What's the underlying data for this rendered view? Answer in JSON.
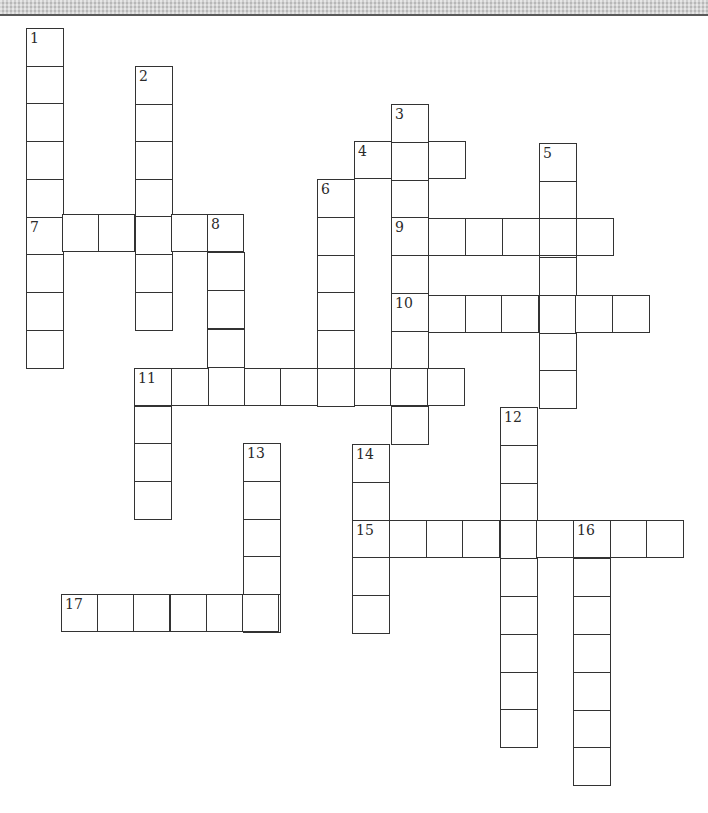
{
  "puzzle": {
    "cell_size": 37,
    "top_band_color": "#cdcdcd",
    "line_color": "#333333",
    "entries": [
      {
        "number": "1",
        "direction": "down",
        "x": 26,
        "y": 28,
        "length": 9,
        "step": 37.7
      },
      {
        "number": "2",
        "direction": "down",
        "x": 135,
        "y": 66,
        "length": 7,
        "step": 37.6
      },
      {
        "number": "3",
        "direction": "down",
        "x": 391,
        "y": 104,
        "length": 9,
        "step": 37.8
      },
      {
        "number": "4",
        "direction": "across",
        "x": 354,
        "y": 141,
        "length": 3,
        "step": 36.8
      },
      {
        "number": "5",
        "direction": "down",
        "x": 539,
        "y": 143,
        "length": 7,
        "step": 37.9
      },
      {
        "number": "6",
        "direction": "down",
        "x": 317,
        "y": 179,
        "length": 6,
        "step": 37.8
      },
      {
        "number": "7",
        "direction": "across",
        "x": 26,
        "y": 214,
        "length": 6,
        "step": 36.2
      },
      {
        "number": "8",
        "direction": "down",
        "x": 207,
        "y": 214,
        "length": 5,
        "step": 38.2
      },
      {
        "number": "9",
        "direction": "across",
        "x": 391,
        "y": 218,
        "length": 6,
        "step": 36.9
      },
      {
        "number": "10",
        "direction": "across",
        "x": 391,
        "y": 295,
        "length": 7,
        "step": 36.8
      },
      {
        "number": "11",
        "direction": "across",
        "x": 134,
        "y": 368,
        "length": 9,
        "step": 36.6
      },
      {
        "number": "11",
        "direction": "down",
        "x": 134,
        "y": 368,
        "length": 4,
        "step": 37.7
      },
      {
        "number": "12",
        "direction": "down",
        "x": 500,
        "y": 407,
        "length": 9,
        "step": 37.8
      },
      {
        "number": "13",
        "direction": "down",
        "x": 243,
        "y": 443,
        "length": 5,
        "step": 37.8
      },
      {
        "number": "14",
        "direction": "down",
        "x": 352,
        "y": 444,
        "length": 5,
        "step": 37.8
      },
      {
        "number": "15",
        "direction": "across",
        "x": 352,
        "y": 520,
        "length": 9,
        "step": 36.8
      },
      {
        "number": "16",
        "direction": "down",
        "x": 573,
        "y": 520,
        "length": 7,
        "step": 37.9
      },
      {
        "number": "17",
        "direction": "across",
        "x": 61,
        "y": 594,
        "length": 6,
        "step": 36.2
      }
    ]
  }
}
